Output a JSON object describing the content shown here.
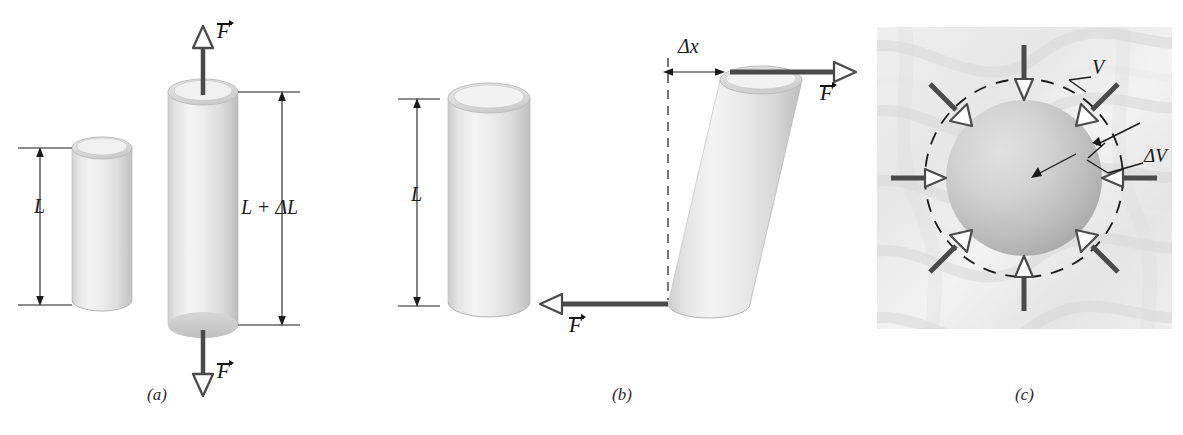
{
  "figure": {
    "background_color": "#ffffff"
  },
  "panels": [
    {
      "id": "a",
      "caption": "(a)",
      "type": "tensile-stress",
      "labels": {
        "length_original": "L",
        "length_stretched": "L + ΔL",
        "force": "F",
        "force_vector_symbol": "→"
      },
      "forces": [
        {
          "name": "top-force",
          "direction": "up",
          "label": "F"
        },
        {
          "name": "bottom-force",
          "direction": "down",
          "label": "F"
        }
      ],
      "objects": [
        "unstressed-cylinder",
        "stretched-cylinder"
      ]
    },
    {
      "id": "b",
      "caption": "(b)",
      "type": "shearing-stress",
      "labels": {
        "length_original": "L",
        "displacement": "Δx",
        "force": "F"
      },
      "forces": [
        {
          "name": "top-force",
          "direction": "right",
          "label": "F"
        },
        {
          "name": "bottom-force",
          "direction": "left",
          "label": "F"
        }
      ],
      "objects": [
        "unstressed-cylinder",
        "sheared-cylinder",
        "reference-dashed-line"
      ]
    },
    {
      "id": "c",
      "caption": "(c)",
      "type": "hydraulic-stress",
      "labels": {
        "volume": "V",
        "volume_change": "ΔV"
      },
      "forces": [
        {
          "name": "pressure-arrow-n",
          "angle_deg": 90,
          "label": ""
        },
        {
          "name": "pressure-arrow-ne",
          "angle_deg": 45,
          "label": ""
        },
        {
          "name": "pressure-arrow-e",
          "angle_deg": 0,
          "label": ""
        },
        {
          "name": "pressure-arrow-se",
          "angle_deg": 315,
          "label": ""
        },
        {
          "name": "pressure-arrow-s",
          "angle_deg": 270,
          "label": ""
        },
        {
          "name": "pressure-arrow-sw",
          "angle_deg": 225,
          "label": ""
        },
        {
          "name": "pressure-arrow-w",
          "angle_deg": 180,
          "label": ""
        },
        {
          "name": "pressure-arrow-nw",
          "angle_deg": 135,
          "label": ""
        }
      ],
      "objects": [
        "textured-background",
        "compressed-sphere",
        "dashed-original-outline"
      ]
    }
  ],
  "colors": {
    "cylinder_light": "#f2f2f2",
    "cylinder_mid": "#dcdcdc",
    "cylinder_dark": "#c3c3c3",
    "sphere_light": "#d8d8d8",
    "sphere_dark": "#a8a8a8",
    "arrow_fill": "#ffffff",
    "arrow_stroke": "#4a4a4a",
    "force_bar": "#4a4a4a",
    "dimension_line": "#1a1a1a",
    "background_texture": "#ececec",
    "text": "#1a1a1a"
  }
}
